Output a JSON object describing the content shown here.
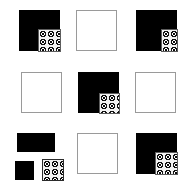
{
  "figure": {
    "type": "visual-reasoning-matrix",
    "title": "",
    "grid": {
      "rows": 3,
      "columns": 3
    },
    "canvas": {
      "width": 191,
      "height": 188,
      "background": "#ffffff"
    },
    "colors": {
      "black_tile": "#000000",
      "empty_tile_fill": "#ffffff",
      "empty_tile_border": "#9a9a9a",
      "patch_fill": "#f2f2f2",
      "patch_dots": "#111111",
      "patch_border": "#5d5d5d"
    },
    "legend": {
      "black_square_label": "black square",
      "empty_square_label": "empty square",
      "dotted_patch_label": "dotted patch"
    },
    "cells": [
      {
        "index": 1,
        "row": 1,
        "column": 1,
        "state": "black-with-patch",
        "patch_corner": "bottom-right",
        "patch_size": "large",
        "exploded": false
      },
      {
        "index": 2,
        "row": 1,
        "column": 2,
        "state": "empty",
        "patch_corner": "none",
        "patch_size": "none",
        "exploded": false
      },
      {
        "index": 3,
        "row": 1,
        "column": 3,
        "state": "black-with-patch",
        "patch_corner": "bottom-right",
        "patch_size": "narrow-tall",
        "exploded": false
      },
      {
        "index": 4,
        "row": 2,
        "column": 1,
        "state": "empty",
        "patch_corner": "none",
        "patch_size": "none",
        "exploded": false
      },
      {
        "index": 5,
        "row": 2,
        "column": 2,
        "state": "black-with-patch",
        "patch_corner": "bottom-right",
        "patch_size": "medium",
        "exploded": false
      },
      {
        "index": 6,
        "row": 2,
        "column": 3,
        "state": "empty",
        "patch_corner": "none",
        "patch_size": "none",
        "exploded": false
      },
      {
        "index": 7,
        "row": 3,
        "column": 1,
        "state": "exploded-pieces",
        "patch_corner": "bottom-right",
        "patch_size": "medium",
        "exploded": true,
        "pieces": [
          {
            "name": "top-bar",
            "shape": "rectangle",
            "fill": "black"
          },
          {
            "name": "bottom-left-block",
            "shape": "square",
            "fill": "black"
          },
          {
            "name": "bottom-right-patch",
            "shape": "square",
            "fill": "dotted"
          }
        ]
      },
      {
        "index": 8,
        "row": 3,
        "column": 2,
        "state": "empty",
        "patch_corner": "none",
        "patch_size": "none",
        "exploded": false
      },
      {
        "index": 9,
        "row": 3,
        "column": 3,
        "state": "black-with-patch",
        "patch_corner": "bottom-right",
        "patch_size": "large",
        "exploded": false
      }
    ]
  }
}
